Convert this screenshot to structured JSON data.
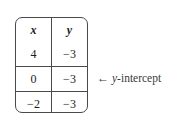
{
  "figure": {
    "name": "table-of-values-with-y-intercept-annotation",
    "table": {
      "headers": [
        "x",
        "y"
      ],
      "rows": [
        {
          "x": "4",
          "y": "−3"
        },
        {
          "x": "0",
          "y": "−3"
        },
        {
          "x": "−2",
          "y": "−3"
        }
      ]
    },
    "annotation": {
      "arrow": "←",
      "variable": "y",
      "text": "-intercept",
      "full_text": "← y-intercept",
      "points_to_row_index": 1
    },
    "colors": {
      "border": "#4a4a4a",
      "text": "#1c1c1c",
      "annotation_text": "#3a3a3a",
      "background": "#ffffff"
    }
  }
}
